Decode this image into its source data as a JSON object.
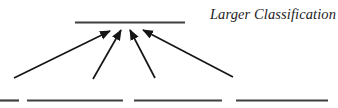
{
  "label": {
    "text": "Larger Classification"
  },
  "colors": {
    "background": "#ffffff",
    "rule_line": "#3f3f3f",
    "arrow": "#161616",
    "text": "#1c1c1c"
  },
  "diagram": {
    "top_line": {
      "x1": 75,
      "y1": 22.5,
      "x2": 185,
      "y2": 22.5,
      "stroke_width": 2.2
    },
    "bottom_segments": [
      {
        "x1": 0,
        "y1": 100.5,
        "x2": 19,
        "y2": 100.5
      },
      {
        "x1": 27,
        "y1": 100.5,
        "x2": 123,
        "y2": 100.5
      },
      {
        "x1": 134,
        "y1": 100.5,
        "x2": 222,
        "y2": 100.5
      },
      {
        "x1": 236,
        "y1": 100.5,
        "x2": 328,
        "y2": 100.5
      }
    ],
    "bottom_stroke_width": 2.2,
    "arrows": [
      {
        "x1": 14,
        "y1": 78,
        "x2": 110,
        "y2": 31
      },
      {
        "x1": 93,
        "y1": 79,
        "x2": 121,
        "y2": 30
      },
      {
        "x1": 155,
        "y1": 78,
        "x2": 130,
        "y2": 30
      },
      {
        "x1": 233,
        "y1": 77,
        "x2": 143,
        "y2": 30
      }
    ],
    "arrow_stroke_width": 1.7
  }
}
